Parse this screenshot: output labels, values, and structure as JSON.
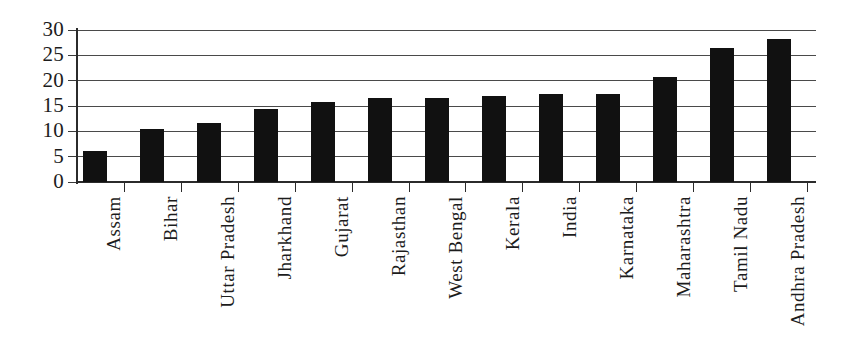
{
  "chart_data": {
    "type": "bar",
    "title": "",
    "subtitle": "",
    "xlabel": "",
    "ylabel": "",
    "categories": [
      "Assam",
      "Bihar",
      "Uttar Pradesh",
      "Jharkhand",
      "Gujarat",
      "Rajasthan",
      "West Bengal",
      "Kerala",
      "India",
      "Karnataka",
      "Maharashtra",
      "Tamil Nadu",
      "Andhra Pradesh"
    ],
    "values": [
      6.2,
      10.5,
      11.7,
      14.5,
      15.8,
      16.5,
      16.5,
      17.0,
      17.4,
      17.4,
      20.7,
      26.4,
      28.3
    ],
    "ylim": [
      0,
      30
    ],
    "y_ticks": [
      0,
      5,
      10,
      15,
      20,
      25,
      30
    ],
    "y_tick_labels": [
      "0",
      "5",
      "10",
      "15",
      "20",
      "25",
      "30"
    ],
    "x_tick_labels_rotation": "vertical",
    "grid": "horizontal",
    "legend": "none",
    "bar_color": "#111111",
    "gridline_color": "#4a4a4a",
    "axis_color": "#2b2b2b",
    "background_color": "#ffffff"
  },
  "axis": {
    "y_labels": [
      "30",
      "25",
      "20",
      "15",
      "10",
      "5",
      "0"
    ]
  },
  "icons": {
    "y_tick": "tick-mark-icon",
    "x_tick": "tick-mark-icon"
  }
}
